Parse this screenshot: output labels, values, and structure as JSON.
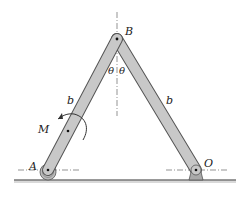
{
  "figure": {
    "colors": {
      "bar_fill": "#c8c8c8",
      "bar_stroke": "#555555",
      "ground": "#777777",
      "ground_shadow": "#d9d9d9",
      "dashed": "#666666",
      "text": "#222222"
    },
    "points": {
      "A": [
        48,
        170
      ],
      "B": [
        117,
        39
      ],
      "O": [
        196,
        170
      ],
      "M_center": [
        68,
        131
      ]
    },
    "labels": {
      "B": "B",
      "A": "A",
      "O": "O",
      "M": "M",
      "bar_left": "b",
      "bar_right": "b",
      "theta_left": "θ",
      "theta_right": "θ"
    }
  }
}
